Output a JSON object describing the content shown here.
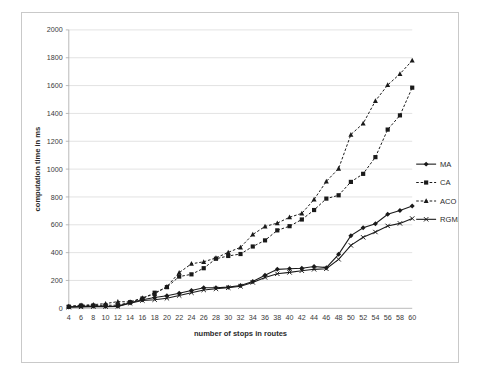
{
  "chart_data": {
    "type": "line",
    "title": "",
    "xlabel": "number of stops in routes",
    "ylabel": "computation time in ms",
    "x": [
      4,
      6,
      8,
      10,
      12,
      14,
      16,
      18,
      20,
      22,
      24,
      26,
      28,
      30,
      32,
      34,
      36,
      38,
      40,
      42,
      44,
      46,
      48,
      50,
      52,
      54,
      56,
      58,
      60
    ],
    "xlim": [
      4,
      60
    ],
    "ylim": [
      0,
      2000
    ],
    "xticks": [
      "4",
      "6",
      "8",
      "10",
      "12",
      "14",
      "16",
      "18",
      "20",
      "22",
      "24",
      "26",
      "28",
      "30",
      "32",
      "34",
      "36",
      "38",
      "40",
      "42",
      "44",
      "46",
      "48",
      "50",
      "52",
      "54",
      "56",
      "58",
      "60"
    ],
    "yticks": [
      "0",
      "200",
      "400",
      "600",
      "800",
      "1000",
      "1200",
      "1400",
      "1600",
      "1800",
      "2000"
    ],
    "grid": true,
    "legend_position": "right",
    "series": [
      {
        "name": "MA",
        "marker": "diamond",
        "dash": "solid",
        "color": "#1a1a1a",
        "values": [
          10,
          14,
          16,
          14,
          16,
          40,
          62,
          78,
          90,
          108,
          128,
          148,
          148,
          152,
          164,
          192,
          238,
          280,
          284,
          288,
          300,
          292,
          388,
          522,
          578,
          608,
          676,
          702,
          735
        ]
      },
      {
        "name": "CA",
        "marker": "square",
        "dash": "dashed",
        "color": "#1a1a1a",
        "values": [
          12,
          20,
          20,
          22,
          22,
          44,
          70,
          112,
          152,
          228,
          244,
          288,
          356,
          376,
          390,
          444,
          488,
          560,
          590,
          638,
          706,
          788,
          812,
          908,
          966,
          1086,
          1284,
          1386,
          1585
        ]
      },
      {
        "name": "ACO",
        "marker": "triangle",
        "dash": "dashed",
        "color": "#1a1a1a",
        "values": [
          14,
          22,
          26,
          34,
          48,
          46,
          74,
          104,
          156,
          256,
          320,
          334,
          362,
          402,
          438,
          530,
          588,
          612,
          654,
          682,
          782,
          912,
          1004,
          1248,
          1328,
          1490,
          1604,
          1684,
          1780
        ]
      },
      {
        "name": "RGMA",
        "marker": "x",
        "dash": "solid",
        "color": "#1a1a1a",
        "values": [
          8,
          10,
          12,
          12,
          14,
          36,
          56,
          62,
          72,
          92,
          112,
          132,
          140,
          148,
          158,
          186,
          222,
          248,
          258,
          270,
          280,
          284,
          352,
          452,
          510,
          548,
          592,
          610,
          645
        ]
      }
    ]
  },
  "legend": {
    "items": [
      {
        "label": "MA"
      },
      {
        "label": "CA"
      },
      {
        "label": "ACO"
      },
      {
        "label": "RGMA"
      }
    ]
  }
}
